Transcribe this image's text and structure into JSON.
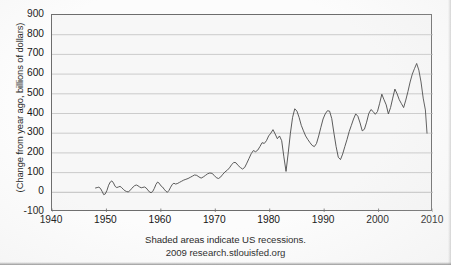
{
  "chart_data": {
    "type": "line",
    "title": "",
    "subtitle": "",
    "xlabel": "",
    "ylabel": "(Change from year ago, billions of dollars)",
    "xlim": [
      1940,
      2010
    ],
    "ylim": [
      -100,
      900
    ],
    "xticks": [
      1940,
      1950,
      1960,
      1970,
      1980,
      1990,
      2000,
      2010
    ],
    "yticks": [
      -100,
      0,
      100,
      200,
      300,
      400,
      500,
      600,
      700,
      800,
      900
    ],
    "grid": "horizontal",
    "legend": "none",
    "line_color": "#4a4a4a",
    "plot_background": "#f7f7f7",
    "frame_color": "#6d6d6d",
    "gridline_color": "#b9b9b9",
    "annotations": [
      "Shaded areas indicate US recessions.",
      "2009 research.stlouisfed.org"
    ],
    "series": [
      {
        "name": "Change from year ago",
        "x": [
          1948.0,
          1948.3,
          1948.6,
          1948.9,
          1949.2,
          1949.5,
          1949.8,
          1950.1,
          1950.4,
          1950.7,
          1951.0,
          1951.3,
          1951.6,
          1951.9,
          1952.2,
          1952.5,
          1952.8,
          1953.1,
          1953.4,
          1953.7,
          1954.0,
          1954.3,
          1954.6,
          1954.9,
          1955.2,
          1955.5,
          1955.8,
          1956.1,
          1956.4,
          1956.7,
          1957.0,
          1957.3,
          1957.6,
          1957.9,
          1958.2,
          1958.5,
          1958.8,
          1959.1,
          1959.4,
          1959.7,
          1960.0,
          1960.3,
          1960.6,
          1960.9,
          1961.2,
          1961.5,
          1961.8,
          1962.1,
          1962.4,
          1962.7,
          1963.0,
          1963.4,
          1963.8,
          1964.2,
          1964.6,
          1965.0,
          1965.4,
          1965.8,
          1966.2,
          1966.6,
          1967.0,
          1967.4,
          1967.8,
          1968.2,
          1968.6,
          1969.0,
          1969.4,
          1969.8,
          1970.2,
          1970.6,
          1971.0,
          1971.4,
          1971.8,
          1972.2,
          1972.6,
          1973.0,
          1973.4,
          1973.8,
          1974.2,
          1974.6,
          1975.0,
          1975.4,
          1975.8,
          1976.2,
          1976.6,
          1977.0,
          1977.4,
          1977.8,
          1978.2,
          1978.6,
          1979.0,
          1979.4,
          1979.8,
          1980.2,
          1980.6,
          1981.0,
          1981.4,
          1981.8,
          1982.2,
          1982.6,
          1983.0,
          1983.4,
          1983.8,
          1984.2,
          1984.6,
          1985.0,
          1985.4,
          1985.8,
          1986.2,
          1986.6,
          1987.0,
          1987.4,
          1987.8,
          1988.2,
          1988.6,
          1989.0,
          1989.4,
          1989.8,
          1990.2,
          1990.6,
          1991.0,
          1991.4,
          1991.8,
          1992.2,
          1992.6,
          1993.0,
          1993.4,
          1993.8,
          1994.2,
          1994.6,
          1995.0,
          1995.4,
          1995.8,
          1996.2,
          1996.6,
          1997.0,
          1997.4,
          1997.8,
          1998.2,
          1998.6,
          1999.0,
          1999.4,
          1999.8,
          2000.2,
          2000.6,
          2001.0,
          2001.4,
          2001.8,
          2002.2,
          2002.6,
          2003.0,
          2003.4,
          2003.8,
          2004.2,
          2004.6,
          2005.0,
          2005.4,
          2005.8,
          2006.2,
          2006.6,
          2007.0,
          2007.4,
          2007.8,
          2008.2,
          2008.6,
          2008.9
        ],
        "values": [
          22,
          24,
          26,
          20,
          5,
          -12,
          -8,
          10,
          36,
          52,
          58,
          47,
          30,
          24,
          27,
          30,
          24,
          15,
          8,
          4,
          2,
          8,
          18,
          27,
          34,
          37,
          33,
          27,
          23,
          25,
          27,
          22,
          12,
          2,
          -2,
          4,
          20,
          40,
          52,
          46,
          33,
          27,
          16,
          6,
          0,
          10,
          26,
          40,
          46,
          42,
          44,
          50,
          56,
          62,
          66,
          70,
          76,
          82,
          88,
          86,
          78,
          72,
          78,
          86,
          94,
          98,
          96,
          86,
          74,
          70,
          78,
          92,
          104,
          112,
          124,
          140,
          152,
          150,
          136,
          126,
          118,
          126,
          148,
          172,
          196,
          212,
          206,
          214,
          232,
          252,
          248,
          262,
          286,
          300,
          318,
          296,
          272,
          286,
          262,
          180,
          106,
          200,
          300,
          380,
          424,
          412,
          380,
          340,
          312,
          286,
          268,
          252,
          238,
          232,
          248,
          286,
          330,
          372,
          398,
          414,
          412,
          374,
          300,
          232,
          178,
          166,
          194,
          232,
          268,
          308,
          340,
          372,
          398,
          386,
          352,
          312,
          320,
          356,
          400,
          420,
          410,
          396,
          410,
          452,
          498,
          470,
          444,
          398,
          430,
          478,
          524,
          500,
          470,
          450,
          430,
          468,
          512,
          560,
          600,
          628,
          654,
          620,
          560,
          478,
          418,
          300
        ]
      }
    ],
    "notes": {
      "series_start_year": 1948,
      "series_end_year": 2009,
      "max_value": 830,
      "max_value_year": 2006,
      "min_value": -12,
      "min_value_year": 1949
    }
  },
  "axes": {
    "y_tick_labels": [
      "900",
      "800",
      "700",
      "600",
      "500",
      "400",
      "300",
      "200",
      "100",
      "0",
      "-100"
    ],
    "x_tick_labels": [
      "1940",
      "1950",
      "1960",
      "1970",
      "1980",
      "1990",
      "2000",
      "2010"
    ],
    "y_axis_title": "(Change from year ago, billions of dollars)"
  },
  "captions": {
    "line1": "Shaded areas indicate US recessions.",
    "line2": "2009 research.stlouisfed.org"
  }
}
